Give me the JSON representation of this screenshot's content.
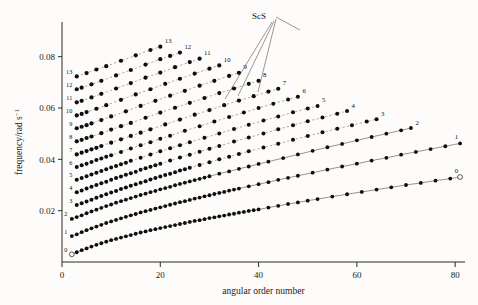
{
  "figure": {
    "background_color": "#fdfcfa",
    "ink_color": "#1a1a1a"
  },
  "axes": {
    "x": {
      "label": "angular order number",
      "ticks": [
        "0",
        "20",
        "40",
        "60",
        "80"
      ],
      "tick_values": [
        0,
        20,
        40,
        60,
        80
      ],
      "range": [
        0,
        82
      ]
    },
    "y": {
      "label": "frequency/rad s",
      "label_exponent": "−1",
      "ticks": [
        "0.02",
        "0.04",
        "0.06",
        "0.08"
      ],
      "tick_values": [
        0.02,
        0.04,
        0.06,
        0.08
      ],
      "range": [
        0.0,
        0.0935
      ]
    }
  },
  "annotations": [
    {
      "name": "scs-annotation",
      "text": "ScS"
    }
  ],
  "chart_data": {
    "type": "scatter",
    "title": "",
    "xlabel": "angular order number",
    "ylabel": "frequency/rad s−1",
    "xlim": [
      0,
      82
    ],
    "ylim": [
      0,
      0.0935
    ],
    "grid": false,
    "legend": "none",
    "marker": "filled-circle",
    "branch_left_labels": [
      "0",
      "1",
      "2",
      "3",
      "4",
      "5",
      "6",
      "7",
      "8",
      "9",
      "10",
      "11",
      "12",
      "13"
    ],
    "branch_end_labels": [
      "0",
      "1",
      "2",
      "3",
      "4",
      "5",
      "6",
      "7",
      "8",
      "9",
      "10",
      "11",
      "12",
      "13"
    ],
    "series": [
      {
        "name": "0",
        "label": "0",
        "x": [
          2,
          3,
          4,
          5,
          6,
          7,
          8,
          9,
          10,
          11,
          12,
          13,
          14,
          15,
          16,
          17,
          18,
          19,
          20,
          21,
          22,
          23,
          24,
          25,
          26,
          27,
          28,
          29,
          30,
          31,
          32,
          33,
          34,
          35,
          36,
          37,
          38,
          39,
          40,
          42,
          44,
          46,
          48,
          50,
          52,
          55,
          58,
          61,
          64,
          67,
          70,
          73,
          76,
          79,
          81
        ],
        "y": [
          0.003,
          0.0038,
          0.0046,
          0.0053,
          0.006,
          0.0067,
          0.0073,
          0.0079,
          0.0085,
          0.009,
          0.0095,
          0.01,
          0.0105,
          0.011,
          0.0115,
          0.0119,
          0.0124,
          0.0128,
          0.0132,
          0.0136,
          0.014,
          0.0144,
          0.0148,
          0.0152,
          0.0156,
          0.016,
          0.0163,
          0.0167,
          0.0171,
          0.0174,
          0.0178,
          0.0181,
          0.0185,
          0.0188,
          0.0192,
          0.0195,
          0.0199,
          0.0202,
          0.0205,
          0.0212,
          0.0219,
          0.0226,
          0.0232,
          0.0239,
          0.0245,
          0.0255,
          0.0264,
          0.0273,
          0.0282,
          0.0291,
          0.03,
          0.0308,
          0.0317,
          0.0325,
          0.0331
        ]
      },
      {
        "name": "1",
        "label": "1",
        "x": [
          2,
          3,
          4,
          5,
          6,
          7,
          8,
          9,
          10,
          11,
          12,
          13,
          14,
          15,
          16,
          17,
          18,
          19,
          20,
          21,
          22,
          23,
          24,
          25,
          26,
          27,
          28,
          29,
          30,
          31,
          32,
          33,
          34,
          35,
          36,
          38,
          40,
          42,
          44,
          46,
          48,
          51,
          54,
          57,
          60,
          63,
          66,
          69,
          72,
          75,
          78,
          81
        ],
        "y": [
          0.0101,
          0.0108,
          0.0116,
          0.0124,
          0.0131,
          0.0138,
          0.0145,
          0.0152,
          0.0158,
          0.0164,
          0.017,
          0.0176,
          0.0182,
          0.0187,
          0.0193,
          0.0198,
          0.0203,
          0.0208,
          0.0213,
          0.0218,
          0.0223,
          0.0228,
          0.0233,
          0.0237,
          0.0242,
          0.0247,
          0.0251,
          0.0256,
          0.026,
          0.0265,
          0.0269,
          0.0273,
          0.0278,
          0.0282,
          0.0286,
          0.0295,
          0.0303,
          0.0311,
          0.032,
          0.0328,
          0.0336,
          0.0348,
          0.036,
          0.0372,
          0.0383,
          0.0395,
          0.0406,
          0.0418,
          0.0429,
          0.044,
          0.0451,
          0.0462
        ]
      },
      {
        "name": "2",
        "label": "2",
        "x": [
          2,
          3,
          4,
          5,
          6,
          7,
          8,
          9,
          10,
          11,
          12,
          13,
          14,
          15,
          16,
          17,
          18,
          19,
          20,
          21,
          22,
          23,
          24,
          25,
          26,
          27,
          28,
          29,
          30,
          32,
          34,
          36,
          38,
          40,
          42,
          45,
          48,
          51,
          54,
          57,
          60,
          63,
          66,
          69,
          71
        ],
        "y": [
          0.0168,
          0.0175,
          0.0182,
          0.019,
          0.0197,
          0.0204,
          0.0211,
          0.0218,
          0.0224,
          0.0231,
          0.0237,
          0.0243,
          0.0249,
          0.0255,
          0.0261,
          0.0266,
          0.0272,
          0.0277,
          0.0283,
          0.0288,
          0.0293,
          0.0299,
          0.0304,
          0.0309,
          0.0314,
          0.0319,
          0.0324,
          0.0329,
          0.0334,
          0.0344,
          0.0353,
          0.0363,
          0.0372,
          0.0382,
          0.0391,
          0.0405,
          0.0419,
          0.0433,
          0.0447,
          0.046,
          0.0474,
          0.0487,
          0.05,
          0.0513,
          0.0522
        ]
      },
      {
        "name": "3",
        "label": "3",
        "x": [
          3,
          4,
          5,
          6,
          7,
          8,
          9,
          10,
          11,
          12,
          13,
          14,
          15,
          16,
          17,
          18,
          19,
          20,
          21,
          22,
          23,
          24,
          25,
          26,
          28,
          30,
          32,
          34,
          36,
          38,
          41,
          44,
          47,
          50,
          53,
          56,
          59,
          62,
          64
        ],
        "y": [
          0.0222,
          0.0229,
          0.0236,
          0.0243,
          0.025,
          0.0257,
          0.0264,
          0.0271,
          0.0277,
          0.0284,
          0.029,
          0.0297,
          0.0303,
          0.0309,
          0.0315,
          0.0321,
          0.0327,
          0.0333,
          0.0339,
          0.0344,
          0.035,
          0.0356,
          0.0361,
          0.0367,
          0.0378,
          0.0389,
          0.04,
          0.041,
          0.0421,
          0.0431,
          0.0446,
          0.0461,
          0.0476,
          0.0491,
          0.0505,
          0.0519,
          0.0533,
          0.0547,
          0.0556
        ]
      },
      {
        "name": "4",
        "label": "4",
        "x": [
          3,
          4,
          5,
          6,
          7,
          8,
          9,
          10,
          11,
          12,
          13,
          14,
          15,
          16,
          17,
          18,
          19,
          20,
          22,
          24,
          26,
          28,
          30,
          32,
          35,
          38,
          41,
          44,
          47,
          50,
          53,
          56,
          58
        ],
        "y": [
          0.0272,
          0.0279,
          0.0286,
          0.0293,
          0.03,
          0.0307,
          0.0313,
          0.032,
          0.0327,
          0.0333,
          0.034,
          0.0346,
          0.0352,
          0.0359,
          0.0365,
          0.0371,
          0.0377,
          0.0383,
          0.0395,
          0.0407,
          0.0418,
          0.043,
          0.0441,
          0.0452,
          0.0469,
          0.0485,
          0.0501,
          0.0517,
          0.0533,
          0.0548,
          0.0563,
          0.0578,
          0.0588
        ]
      },
      {
        "name": "5",
        "label": "5",
        "x": [
          3,
          4,
          5,
          6,
          7,
          8,
          9,
          10,
          11,
          12,
          13,
          14,
          16,
          18,
          20,
          22,
          24,
          26,
          29,
          32,
          35,
          38,
          41,
          44,
          47,
          50,
          52
        ],
        "y": [
          0.032,
          0.0327,
          0.0334,
          0.0341,
          0.0348,
          0.0355,
          0.0361,
          0.0368,
          0.0374,
          0.0381,
          0.0387,
          0.0394,
          0.0406,
          0.0419,
          0.0431,
          0.0443,
          0.0455,
          0.0467,
          0.0484,
          0.0501,
          0.0518,
          0.0535,
          0.0551,
          0.0567,
          0.0583,
          0.0598,
          0.0608
        ]
      },
      {
        "name": "6",
        "label": "6",
        "x": [
          3,
          4,
          5,
          6,
          7,
          8,
          9,
          10,
          12,
          14,
          16,
          18,
          20,
          22,
          25,
          28,
          31,
          34,
          37,
          40,
          43,
          46,
          48
        ],
        "y": [
          0.037,
          0.0377,
          0.0383,
          0.039,
          0.0397,
          0.0403,
          0.041,
          0.0416,
          0.0429,
          0.0442,
          0.0455,
          0.0467,
          0.048,
          0.0492,
          0.0511,
          0.0529,
          0.0547,
          0.0565,
          0.0582,
          0.06,
          0.0617,
          0.0633,
          0.0644
        ]
      },
      {
        "name": "7",
        "label": "7",
        "x": [
          3,
          4,
          5,
          6,
          7,
          8,
          10,
          12,
          14,
          16,
          18,
          21,
          24,
          27,
          30,
          33,
          36,
          39,
          42,
          44
        ],
        "y": [
          0.0419,
          0.0426,
          0.0432,
          0.0439,
          0.0445,
          0.0452,
          0.0465,
          0.0478,
          0.0491,
          0.0504,
          0.0517,
          0.0536,
          0.0555,
          0.0574,
          0.0592,
          0.0611,
          0.0629,
          0.0646,
          0.0664,
          0.0675
        ]
      },
      {
        "name": "8",
        "label": "8",
        "x": [
          3,
          4,
          5,
          6,
          8,
          10,
          12,
          14,
          17,
          20,
          23,
          26,
          29,
          32,
          35,
          38,
          40
        ],
        "y": [
          0.047,
          0.0476,
          0.0483,
          0.0489,
          0.0502,
          0.0516,
          0.0529,
          0.0542,
          0.0562,
          0.0582,
          0.0601,
          0.062,
          0.0639,
          0.0658,
          0.0676,
          0.0694,
          0.0706
        ]
      },
      {
        "name": "9",
        "label": "9",
        "x": [
          3,
          4,
          5,
          6,
          8,
          10,
          13,
          16,
          19,
          22,
          25,
          28,
          31,
          34,
          36
        ],
        "y": [
          0.0521,
          0.0527,
          0.0533,
          0.054,
          0.0553,
          0.0567,
          0.0587,
          0.0608,
          0.0628,
          0.0648,
          0.0667,
          0.0687,
          0.0706,
          0.0725,
          0.0737
        ]
      },
      {
        "name": "10",
        "label": "10",
        "x": [
          3,
          4,
          5,
          7,
          9,
          12,
          15,
          18,
          21,
          24,
          27,
          30,
          32
        ],
        "y": [
          0.0571,
          0.0577,
          0.0584,
          0.0597,
          0.0611,
          0.0632,
          0.0653,
          0.0673,
          0.0694,
          0.0714,
          0.0734,
          0.0753,
          0.0766
        ]
      },
      {
        "name": "11",
        "label": "11",
        "x": [
          3,
          4,
          6,
          8,
          11,
          14,
          17,
          20,
          23,
          26,
          28
        ],
        "y": [
          0.0622,
          0.0628,
          0.0641,
          0.0655,
          0.0676,
          0.0697,
          0.0718,
          0.0738,
          0.0759,
          0.0779,
          0.0792
        ]
      },
      {
        "name": "12",
        "label": "12",
        "x": [
          3,
          4,
          6,
          8,
          11,
          14,
          17,
          20,
          22,
          24
        ],
        "y": [
          0.0673,
          0.0679,
          0.0692,
          0.0706,
          0.0727,
          0.0748,
          0.0769,
          0.079,
          0.0803,
          0.0816
        ]
      },
      {
        "name": "13",
        "label": "13",
        "x": [
          3,
          5,
          7,
          9,
          12,
          15,
          18,
          20
        ],
        "y": [
          0.0723,
          0.0736,
          0.075,
          0.0763,
          0.0784,
          0.0805,
          0.0826,
          0.0839
        ]
      }
    ]
  }
}
